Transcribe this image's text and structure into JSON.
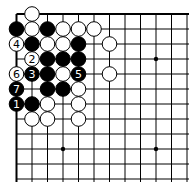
{
  "board": {
    "origin_x": 16.5,
    "origin_y": 14,
    "spacing_x": 15.5,
    "spacing_y": 15,
    "cols": 12,
    "rows": 12,
    "edges": [
      "top",
      "left"
    ],
    "star_points": [
      [
        3,
        3
      ],
      [
        9,
        3
      ],
      [
        3,
        9
      ],
      [
        9,
        9
      ]
    ]
  },
  "stones": [
    {
      "c": 1,
      "r": 0,
      "color": "white",
      "label": ""
    },
    {
      "c": 0,
      "r": 1,
      "color": "black",
      "label": ""
    },
    {
      "c": 1,
      "r": 1,
      "color": "white",
      "label": ""
    },
    {
      "c": 2,
      "r": 1,
      "color": "black",
      "label": ""
    },
    {
      "c": 3,
      "r": 1,
      "color": "white",
      "label": ""
    },
    {
      "c": 4,
      "r": 1,
      "color": "white",
      "label": ""
    },
    {
      "c": 5,
      "r": 1,
      "color": "white",
      "label": ""
    },
    {
      "c": 0,
      "r": 2,
      "color": "white",
      "label": "4"
    },
    {
      "c": 1,
      "r": 2,
      "color": "black",
      "label": ""
    },
    {
      "c": 2,
      "r": 2,
      "color": "white",
      "label": ""
    },
    {
      "c": 3,
      "r": 2,
      "color": "white",
      "label": ""
    },
    {
      "c": 4,
      "r": 2,
      "color": "black",
      "label": ""
    },
    {
      "c": 6,
      "r": 2,
      "color": "white",
      "label": ""
    },
    {
      "c": 1,
      "r": 3,
      "color": "white",
      "label": "2"
    },
    {
      "c": 2,
      "r": 3,
      "color": "black",
      "label": ""
    },
    {
      "c": 3,
      "r": 3,
      "color": "black",
      "label": ""
    },
    {
      "c": 4,
      "r": 3,
      "color": "black",
      "label": ""
    },
    {
      "c": 0,
      "r": 4,
      "color": "white",
      "label": "6"
    },
    {
      "c": 1,
      "r": 4,
      "color": "black",
      "label": "3"
    },
    {
      "c": 2,
      "r": 4,
      "color": "black",
      "label": ""
    },
    {
      "c": 3,
      "r": 4,
      "color": "white",
      "label": ""
    },
    {
      "c": 4,
      "r": 4,
      "color": "black",
      "label": "5"
    },
    {
      "c": 6,
      "r": 4,
      "color": "white",
      "label": ""
    },
    {
      "c": 0,
      "r": 5,
      "color": "black",
      "label": "7"
    },
    {
      "c": 2,
      "r": 5,
      "color": "black",
      "label": ""
    },
    {
      "c": 3,
      "r": 5,
      "color": "black",
      "label": ""
    },
    {
      "c": 4,
      "r": 5,
      "color": "white",
      "label": ""
    },
    {
      "c": 0,
      "r": 6,
      "color": "black",
      "label": "1"
    },
    {
      "c": 1,
      "r": 6,
      "color": "black",
      "label": ""
    },
    {
      "c": 2,
      "r": 6,
      "color": "white",
      "label": ""
    },
    {
      "c": 4,
      "r": 6,
      "color": "white",
      "label": ""
    },
    {
      "c": 1,
      "r": 7,
      "color": "white",
      "label": ""
    },
    {
      "c": 2,
      "r": 7,
      "color": "white",
      "label": ""
    },
    {
      "c": 4,
      "r": 7,
      "color": "white",
      "label": ""
    }
  ]
}
